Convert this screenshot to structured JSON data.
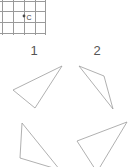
{
  "figure": {
    "title": "",
    "background_color": "#ffffff",
    "line_color": "#9c9c9c",
    "grid_color": "#9a9a9a",
    "label_color": "#555555",
    "width": 131,
    "height": 167
  },
  "grid": {
    "name": "reference-grid",
    "x": 0,
    "y": 0,
    "width": 45,
    "height": 35,
    "cell_size": 11,
    "vertical_lines_x": [
      2,
      13,
      24,
      35,
      45
    ],
    "horizontal_lines_y": [
      1,
      11,
      22,
      33
    ],
    "point": {
      "label": "C",
      "cx": 24,
      "cy": 16,
      "radius": 1.4,
      "label_x": 26.5,
      "label_y": 19.5
    }
  },
  "labels": [
    {
      "text": "1",
      "x": 34,
      "y": 55
    },
    {
      "text": "2",
      "x": 97,
      "y": 55
    }
  ],
  "triangles": [
    {
      "name": "triangle-1",
      "label": "1",
      "points": "62,66 13,90 35,108",
      "vertices": [
        [
          62,
          66
        ],
        [
          13,
          90
        ],
        [
          35,
          108
        ]
      ]
    },
    {
      "name": "triangle-2",
      "label": "2",
      "points": "79,66 104,76 113,109",
      "vertices": [
        [
          79,
          66
        ],
        [
          104,
          76
        ],
        [
          113,
          109
        ]
      ]
    },
    {
      "name": "triangle-3",
      "label": "",
      "points": "22,123 20,158 60,170",
      "vertices": [
        [
          22,
          123
        ],
        [
          20,
          158
        ],
        [
          60,
          170
        ]
      ]
    },
    {
      "name": "triangle-4",
      "label": "",
      "points": "127,122 77,141 97,172",
      "vertices": [
        [
          127,
          122
        ],
        [
          77,
          141
        ],
        [
          97,
          172
        ]
      ]
    }
  ]
}
